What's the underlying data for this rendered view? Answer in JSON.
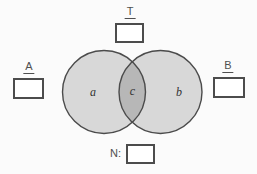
{
  "canvas": {
    "background": "#fbfbfb"
  },
  "labels": {
    "top": "T",
    "left": "A",
    "right": "B",
    "bottom": "N:"
  },
  "venn": {
    "region_labels": {
      "left": "a",
      "intersection": "c",
      "right": "b"
    },
    "colors": {
      "circle_fill": "#d8d8d8",
      "intersection_fill": "#b7b7b7",
      "circle_stroke": "#4b4b4b"
    }
  },
  "inputs": {
    "top_value": "",
    "left_value": "",
    "right_value": "",
    "bottom_value": ""
  }
}
